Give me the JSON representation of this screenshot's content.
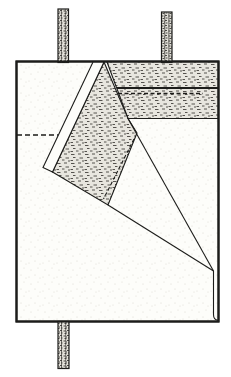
{
  "colors": {
    "ink": "#1c1c1a",
    "paper": "#fdfdfa",
    "paper_dot": "#d9d7cf",
    "stipple_bg": "#e8e6df",
    "stipple_ink": "#45433e",
    "bar_bg": "#e2e0d9",
    "bar_ink": "#3a3835"
  },
  "drawing": {
    "width": 231,
    "height": 377,
    "elements": [
      {
        "type": "rect",
        "name": "sheet-outline",
        "x": 16.5,
        "y": 61.5,
        "w": 202,
        "h": 260,
        "fill": "paper",
        "stroked": true,
        "sw": 2
      },
      {
        "type": "polygon",
        "name": "top-right-folded-band",
        "points": [
          [
            107,
            62
          ],
          [
            218,
            62
          ],
          [
            218,
            118.5
          ],
          [
            128,
            118.5
          ]
        ],
        "fill": "stipple",
        "sw": 1.1
      },
      {
        "type": "polygon",
        "name": "diagonal-folded-band",
        "points": [
          [
            104,
            62
          ],
          [
            128,
            118.5
          ],
          [
            137,
            133
          ],
          [
            108,
            205
          ],
          [
            52.5,
            172
          ]
        ],
        "fill": "stipple",
        "sw": 1.1
      },
      {
        "type": "polygon",
        "name": "diagonal-fold-edge-strip",
        "points": [
          [
            93,
            62
          ],
          [
            104,
            62
          ],
          [
            52.5,
            172
          ],
          [
            43,
            167.5
          ]
        ],
        "fill": "plain",
        "sw": 1.1
      },
      {
        "type": "line",
        "name": "band-seam-line",
        "x1": 117,
        "y1": 88,
        "x2": 218,
        "y2": 88,
        "sw": 2.2
      },
      {
        "type": "line",
        "name": "band-seam-dashed-line",
        "x1": 118,
        "y1": 93.5,
        "x2": 203,
        "y2": 93.5,
        "sw": 1.3,
        "dash": "4 2.5"
      },
      {
        "type": "line",
        "name": "diagonal-band-dashed-fold-line",
        "x1": 134,
        "y1": 139,
        "x2": 103.5,
        "y2": 199,
        "sw": 1.1,
        "dash": "3.5 2.5"
      },
      {
        "type": "line",
        "name": "upper-fold-line",
        "x1": 128,
        "y1": 118.5,
        "x2": 213.5,
        "y2": 271,
        "sw": 1.1
      },
      {
        "type": "line",
        "name": "lower-fold-line",
        "x1": 108,
        "y1": 205,
        "x2": 213.5,
        "y2": 271,
        "sw": 1.1
      },
      {
        "type": "path",
        "name": "right-fold-edge",
        "d": "M213.5,271 L213.5,314.5 Q213.5,320 218,320.3",
        "sw": 1.1
      },
      {
        "type": "line",
        "name": "hidden-fold-dashed-line",
        "x1": 17,
        "y1": 135,
        "x2": 58,
        "y2": 135,
        "sw": 1.3,
        "dash": "5 3"
      },
      {
        "type": "bar",
        "name": "top-left-strap",
        "x": 58,
        "y": 9,
        "w": 10.5,
        "h": 53.5
      },
      {
        "type": "bar",
        "name": "top-right-strap",
        "x": 161.5,
        "y": 12,
        "w": 10.5,
        "h": 50.5
      },
      {
        "type": "bar",
        "name": "bottom-strap",
        "x": 58,
        "y": 321.5,
        "w": 11,
        "h": 47
      },
      {
        "type": "rect",
        "name": "sheet-outline-border",
        "x": 16.5,
        "y": 61.5,
        "w": 202,
        "h": 260,
        "fill": "none",
        "stroked": true,
        "sw": 2
      }
    ]
  }
}
